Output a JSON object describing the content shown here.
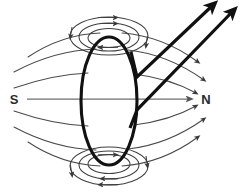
{
  "diagram": {
    "background_color": "#ffffff",
    "labels": {
      "south_pole": "S",
      "north_pole": "N"
    },
    "colors": {
      "field_line": "#4a4a4a",
      "axis_line": "#6e6e6e",
      "loop_stroke": "#111111",
      "conductor_stroke": "#111111",
      "label_text": "#2b2b2b"
    },
    "elements": {
      "current_loop_name": "current-loop-ellipse",
      "magnetic_axis_name": "magnetic-axis-line",
      "conductor_lead_upper_name": "conductor-lead-upper",
      "conductor_lead_lower_name": "conductor-lead-lower",
      "top_vortex_name": "top-field-vortex",
      "bottom_vortex_name": "bottom-field-vortex"
    },
    "geometry": {
      "loop_center_x": 109,
      "loop_center_y": 101,
      "loop_rx": 28,
      "loop_ry": 64,
      "axis_y": 99,
      "axis_x_start": 27,
      "axis_x_end": 197
    },
    "counts": {
      "top_vortex_rings": 3,
      "bottom_vortex_rings": 3,
      "outer_field_lines": 8,
      "conductor_leads": 2,
      "arrowheads_total": 18
    }
  }
}
